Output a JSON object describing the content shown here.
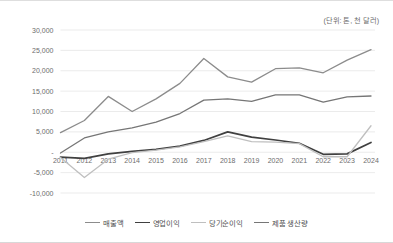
{
  "unit_note": "(단위: 톤, 천 달러)",
  "chart_data": {
    "type": "line",
    "title": "",
    "subtitle": "",
    "xlabel": "",
    "ylabel": "",
    "unit_note": "(단위: 톤, 천 달러)",
    "grid": true,
    "legend_position": "bottom",
    "ylim": [
      -10000,
      30000
    ],
    "ytick_labels": [
      "30,000",
      "25,000",
      "20,000",
      "15,000",
      "10,000",
      "5,000",
      "-",
      "-5,000",
      "-10,000"
    ],
    "ytick_values": [
      30000,
      25000,
      20000,
      15000,
      10000,
      5000,
      0,
      -5000,
      -10000
    ],
    "categories": [
      "2011",
      "2012",
      "2013",
      "2014",
      "2015",
      "2016",
      "2017",
      "2018",
      "2019",
      "2020",
      "2021",
      "2022",
      "2023",
      "2024"
    ],
    "series": [
      {
        "name": "매출액",
        "color": "#8c8c8c",
        "width": 1.3,
        "values": [
          4800,
          7800,
          13700,
          10000,
          13100,
          16900,
          23000,
          18500,
          17200,
          20500,
          20700,
          19500,
          22600,
          25200
        ]
      },
      {
        "name": "영업이익",
        "color": "#404040",
        "width": 1.7,
        "values": [
          -1200,
          -1500,
          -400,
          200,
          700,
          1500,
          2900,
          5000,
          3700,
          3000,
          2200,
          -500,
          -400,
          2400
        ]
      },
      {
        "name": "당기순이익",
        "color": "#bfbfbf",
        "width": 1.3,
        "values": [
          -1300,
          -6200,
          -1700,
          -100,
          500,
          1300,
          2600,
          4000,
          2600,
          2500,
          2100,
          -1100,
          -1100,
          6500
        ]
      },
      {
        "name": "제품 생산량",
        "color": "#767676",
        "width": 1.3,
        "values": [
          -200,
          3500,
          5000,
          6000,
          7400,
          9500,
          12800,
          13100,
          12500,
          14100,
          14100,
          12300,
          13600,
          13800
        ]
      }
    ]
  },
  "legend": {
    "items": [
      {
        "label": "매출액",
        "color": "#8c8c8c"
      },
      {
        "label": "영업이익",
        "color": "#404040"
      },
      {
        "label": "당기순이익",
        "color": "#bfbfbf"
      },
      {
        "label": "제품 생산량",
        "color": "#767676"
      }
    ]
  }
}
